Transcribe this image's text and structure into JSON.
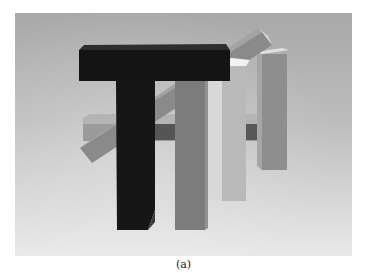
{
  "figure": {
    "caption": "(a)",
    "colors": {
      "background_top": "#a9a9a9",
      "background_bottom": "#e8e8e8",
      "black_block": "#141414",
      "black_block_top": "#2e2e2e",
      "gray_column": "#7c7c7c",
      "light_column": "#b9b9b9",
      "light_column_top": "#f2f2f2",
      "right_column": "#8e8e8e",
      "right_column_top": "#e0e0e0",
      "diagonal_beam": "#8a8a8a",
      "diagonal_beam_end": "#d6d6d6",
      "horizontal_beam": "#9a9a9a",
      "horizontal_beam_dark": "#545454"
    }
  }
}
